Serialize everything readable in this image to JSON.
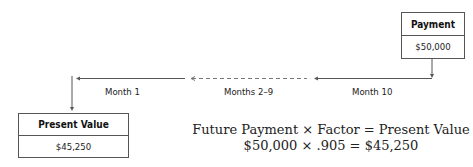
{
  "payment_box": {
    "title": "Payment",
    "value": "$50,000"
  },
  "present_value_box": {
    "title": "Present Value",
    "value": "$45,250"
  },
  "timeline": {
    "labels": [
      {
        "id": "month-1",
        "text": "Month 1"
      },
      {
        "id": "months-2-9",
        "text": "Months 2–9"
      },
      {
        "id": "month-10",
        "text": "Month 10"
      }
    ]
  },
  "formula": {
    "line1": "Future Payment  ×  Factor  =  Present Value",
    "line2": "$50,000  ×  .905  =  $45,250"
  },
  "colors": {
    "line": "#555555",
    "text": "#222222",
    "background": "#ffffff"
  }
}
